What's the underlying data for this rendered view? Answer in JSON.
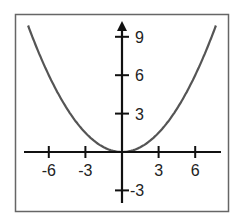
{
  "chart_data": {
    "type": "line",
    "title": "",
    "xlabel": "",
    "ylabel": "",
    "function": "y = x^2 / 6",
    "xlim": [
      -8,
      8
    ],
    "ylim": [
      -4,
      10
    ],
    "grid": false,
    "legend": null,
    "x_ticks": [
      -6,
      -3,
      3,
      6
    ],
    "y_ticks": [
      -3,
      3,
      6,
      9
    ],
    "x_tick_labels": [
      "-6",
      "-3",
      "3",
      "6"
    ],
    "y_tick_labels": [
      "-3",
      "3",
      "6",
      "9"
    ],
    "series": [
      {
        "name": "parabola",
        "x": [
          -7.7,
          -6,
          -3,
          0,
          3,
          6,
          7.7
        ],
        "y": [
          9.9,
          6,
          1.5,
          0,
          1.5,
          6,
          9.9
        ]
      }
    ],
    "colors": {
      "curve": "#555555",
      "axes": "#111111",
      "frame": "#666666"
    }
  }
}
